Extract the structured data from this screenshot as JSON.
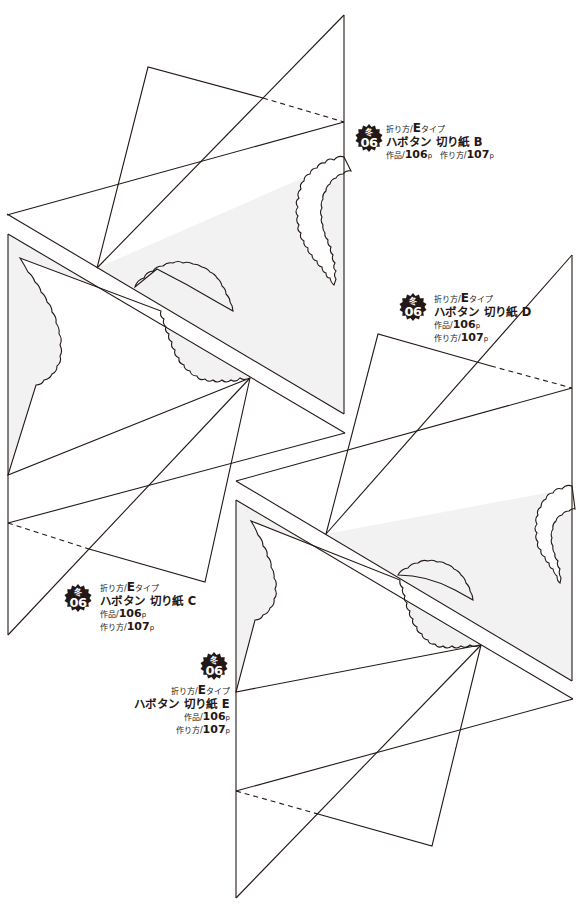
{
  "page": {
    "background": "#ffffff",
    "line_color": "#231815",
    "shade_color": "#f2f2f2"
  },
  "patterns": [
    {
      "id": "B",
      "badge": {
        "season": "冬",
        "number": "06",
        "color": "#231815"
      },
      "fold": {
        "prefix": "折り方/",
        "type": "E",
        "suffix": "タイプ"
      },
      "title": "ハボタン  切り紙 B",
      "work": {
        "label": "作品/",
        "page": "106",
        "unit": "p"
      },
      "howto": {
        "label": "作り方/",
        "page": "107",
        "unit": "p"
      }
    },
    {
      "id": "D",
      "badge": {
        "season": "冬",
        "number": "06",
        "color": "#231815"
      },
      "fold": {
        "prefix": "折り方/",
        "type": "E",
        "suffix": "タイプ"
      },
      "title": "ハボタン  切り紙 D",
      "work": {
        "label": "作品/",
        "page": "106",
        "unit": "p"
      },
      "howto": {
        "label": "作り方/",
        "page": "107",
        "unit": "p"
      }
    },
    {
      "id": "C",
      "badge": {
        "season": "冬",
        "number": "06",
        "color": "#231815"
      },
      "fold": {
        "prefix": "折り方/",
        "type": "E",
        "suffix": "タイプ"
      },
      "title": "ハボタン  切り紙 C",
      "work": {
        "label": "作品/",
        "page": "106",
        "unit": "p"
      },
      "howto": {
        "label": "作り方/",
        "page": "107",
        "unit": "p"
      }
    },
    {
      "id": "E",
      "badge": {
        "season": "冬",
        "number": "06",
        "color": "#231815"
      },
      "fold": {
        "prefix": "折り方/",
        "type": "E",
        "suffix": "タイプ"
      },
      "title": "ハボタン  切り紙 E",
      "work": {
        "label": "作品/",
        "page": "106",
        "unit": "p"
      },
      "howto": {
        "label": "作り方/",
        "page": "107",
        "unit": "p"
      }
    }
  ]
}
